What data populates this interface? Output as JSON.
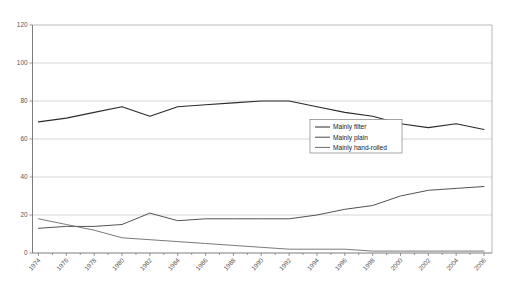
{
  "chart_data": {
    "type": "line",
    "title": "(a) Men",
    "xlabel": "",
    "ylabel": "",
    "ylim": [
      0,
      120
    ],
    "xlim": [
      1974,
      2006
    ],
    "yticks": [
      0,
      20,
      40,
      60,
      80,
      100,
      120
    ],
    "grid": true,
    "legend_position": "center-right",
    "x": [
      1974,
      1976,
      1978,
      1980,
      1982,
      1984,
      1986,
      1988,
      1990,
      1992,
      1994,
      1996,
      1998,
      2000,
      2002,
      2004,
      2006
    ],
    "xticklabels": [
      "1974",
      "1976",
      "1978",
      "1980",
      "1982",
      "1984",
      "1986",
      "1988",
      "1990",
      "1992",
      "1994",
      "1996",
      "1998",
      "2000",
      "2002",
      "2004",
      "2006"
    ],
    "series": [
      {
        "name": "Mainly filter",
        "values": [
          69,
          71,
          74,
          77,
          72,
          77,
          78,
          79,
          80,
          80,
          77,
          74,
          72,
          68,
          66,
          68,
          65
        ]
      },
      {
        "name": "Mainly plain",
        "values": [
          13,
          14,
          14,
          15,
          21,
          17,
          18,
          18,
          18,
          18,
          20,
          23,
          25,
          30,
          33,
          34,
          35
        ]
      },
      {
        "name": "Mainly hand-rolled",
        "values": [
          18,
          15,
          12,
          8,
          7,
          6,
          5,
          4,
          3,
          2,
          2,
          2,
          1,
          1,
          1,
          1,
          1
        ]
      }
    ]
  },
  "legend": {
    "items": [
      {
        "label": "Mainly filter"
      },
      {
        "label": "Mainly plain"
      },
      {
        "label": "Mainly hand-rolled"
      }
    ]
  },
  "axes": {
    "y_tick_labels": [
      "120",
      "100",
      "80",
      "60",
      "40",
      "20",
      "0"
    ],
    "x_tick_labels": [
      "1974",
      "1976",
      "1978",
      "1980",
      "1982",
      "1984",
      "1986",
      "1988",
      "1990",
      "1992",
      "1994",
      "1996",
      "1998",
      "2000",
      "2002",
      "2004",
      "2006"
    ]
  },
  "colors": {
    "grid": "#bdbdbd",
    "axis": "#6e6e6e",
    "series_filter": "#2b2b2b",
    "series_plain": "#4a4a4a",
    "series_hand": "#6a6a6a",
    "background": "#ffffff",
    "text": "#555555"
  }
}
